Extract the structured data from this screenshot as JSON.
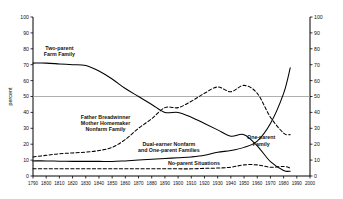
{
  "chart_data": {
    "type": "line",
    "title": "",
    "xlabel": "",
    "ylabel": "percent",
    "xlim": [
      1790,
      2000
    ],
    "ylim": [
      0,
      100
    ],
    "grid": false,
    "legend_position": "inline-labels",
    "reference_line": {
      "y": 50,
      "label": "50"
    },
    "dual_axis": true,
    "x_ticks": [
      1790,
      1800,
      1810,
      1820,
      1830,
      1840,
      1850,
      1860,
      1870,
      1880,
      1890,
      1900,
      1910,
      1920,
      1930,
      1940,
      1950,
      1960,
      1970,
      1980,
      1990,
      2000
    ],
    "y_ticks": [
      0,
      10,
      20,
      30,
      40,
      50,
      60,
      70,
      80,
      90,
      100
    ],
    "y_ticks_right": [
      0,
      10,
      20,
      30,
      40,
      50,
      60,
      70,
      80,
      90,
      100
    ],
    "series": [
      {
        "name": "Two-parent Farm Family",
        "style": "solid",
        "x": [
          1790,
          1800,
          1810,
          1820,
          1830,
          1840,
          1850,
          1860,
          1870,
          1880,
          1890,
          1900,
          1910,
          1920,
          1930,
          1940,
          1950,
          1960,
          1970,
          1980,
          1985
        ],
        "values": [
          71,
          71,
          70.5,
          70,
          69.5,
          66,
          61,
          55,
          50,
          45,
          40,
          40,
          37,
          33,
          29,
          25,
          26,
          19,
          9,
          3.5,
          3
        ]
      },
      {
        "name": "Father Breadwinner Mother Homemaker Nonfarm Family",
        "style": "dashed",
        "x": [
          1790,
          1800,
          1810,
          1820,
          1830,
          1840,
          1850,
          1860,
          1870,
          1880,
          1890,
          1900,
          1910,
          1920,
          1930,
          1940,
          1950,
          1960,
          1970,
          1980,
          1985
        ],
        "values": [
          12,
          13,
          14,
          14.5,
          15,
          16,
          18,
          23,
          30,
          36,
          43,
          43,
          47,
          52,
          56,
          53,
          57,
          52,
          37,
          27,
          26
        ]
      },
      {
        "name": "Dual-earner Nonfarm and One-parent Families",
        "style": "solid",
        "x": [
          1790,
          1800,
          1810,
          1820,
          1830,
          1840,
          1850,
          1860,
          1870,
          1880,
          1890,
          1900,
          1910,
          1920,
          1930,
          1940,
          1950,
          1960,
          1970,
          1980,
          1985
        ],
        "values": [
          9.5,
          9.5,
          9.3,
          9.2,
          9.2,
          9.2,
          9.1,
          9.5,
          10,
          10.5,
          11,
          11.5,
          12,
          13,
          15,
          16,
          18,
          22,
          33,
          52,
          68
        ]
      },
      {
        "name": "No-parent Situations",
        "style": "dashed",
        "x": [
          1790,
          1800,
          1810,
          1820,
          1830,
          1840,
          1850,
          1860,
          1870,
          1880,
          1890,
          1900,
          1910,
          1920,
          1930,
          1940,
          1950,
          1960,
          1970,
          1980,
          1985
        ],
        "values": [
          4.5,
          4.5,
          4.5,
          4.5,
          4.5,
          4.5,
          4.5,
          4.5,
          4.5,
          4.5,
          4.5,
          4.5,
          4.5,
          4.8,
          5,
          5.5,
          7,
          7,
          5.5,
          6,
          5
        ]
      }
    ],
    "annotations": [
      {
        "id": "two-parent-farm-family",
        "text_lines": [
          "Two-parent",
          "Farm Family"
        ],
        "x": 1810,
        "y": 79
      },
      {
        "id": "father-breadwinner",
        "text_lines": [
          "Father Breadwinner",
          "Mother Homemaker",
          "Nonfarm Family"
        ],
        "x": 1845,
        "y": 36
      },
      {
        "id": "dual-earner",
        "text_lines": [
          "Dual-earner Nonfarm",
          "and One-parent Families"
        ],
        "x": 1893,
        "y": 19
      },
      {
        "id": "one-parent-family",
        "text_lines": [
          "One-parent",
          "Family"
        ],
        "x": 1963,
        "y": 23
      },
      {
        "id": "no-parent-situations",
        "text_lines": [
          "No-parent Situations"
        ],
        "x": 1912,
        "y": 7
      }
    ]
  },
  "axis": {
    "y_left_title": "percent"
  },
  "colors": {
    "line": "#000000",
    "axis": "#000000",
    "reference_line": "#9a9a9a",
    "background": "#ffffff"
  }
}
